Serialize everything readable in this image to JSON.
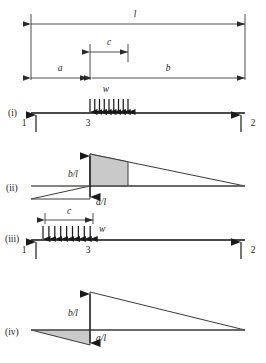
{
  "figure": {
    "colors": {
      "ink": "#1a1a1a",
      "line": "#3a3a3a",
      "beam": "#4a4a4a",
      "shade_fill": "#c9c9c9",
      "background": "#ffffff"
    },
    "dimensions": {
      "span_total": {
        "label": "l",
        "x1": 31,
        "x2": 245,
        "y": 18
      },
      "segment_c_top": {
        "label": "c",
        "x1": 90,
        "x2": 128,
        "y": 48
      },
      "segment_a": {
        "label": "a",
        "x1": 31,
        "x2": 90,
        "y": 76
      },
      "segment_b": {
        "label": "b",
        "x1": 90,
        "x2": 245,
        "y": 76
      }
    },
    "panels": [
      {
        "id": "i",
        "roman": "(i)",
        "roman_x": 8,
        "roman_y": 113,
        "beam_y": 113,
        "beam_x1": 31,
        "beam_x2": 245,
        "load_label": "w",
        "load_label_x": 106,
        "load_label_y": 92,
        "load_x1": 90,
        "load_x2": 128,
        "load_count": 9,
        "load_direction": "down",
        "nodes": [
          {
            "label": "1",
            "x": 24,
            "y": 125,
            "support_x": 36
          },
          {
            "label": "3",
            "x": 88,
            "y": 125,
            "support_x": null
          },
          {
            "label": "2",
            "x": 252,
            "y": 125,
            "support_x": 241
          }
        ]
      },
      {
        "id": "ii",
        "roman": "(ii)",
        "roman_x": 6,
        "roman_y": 188,
        "baseline_y": 186,
        "baseline_x1": 31,
        "baseline_x2": 245,
        "peak_x": 90,
        "peak_top_y": 154,
        "peak_bottom_y": 199,
        "shade_right_x": 128,
        "labels": [
          {
            "text": "b/l",
            "x": 70,
            "y": 174
          },
          {
            "text": "a/l",
            "x": 96,
            "y": 205
          }
        ],
        "shaded_shape": "quad-above",
        "lower_wing_x": 31
      },
      {
        "id": "iii",
        "roman": "(iii)",
        "roman_x": 5,
        "roman_y": 239,
        "beam_y": 240,
        "beam_x1": 31,
        "beam_x2": 245,
        "load_label": "w",
        "load_label_x": 98,
        "load_label_y": 224,
        "load_x1": 36,
        "load_x2": 90,
        "load_count": 9,
        "load_direction": "up",
        "dim_c": {
          "label": "c",
          "x1": 45,
          "x2": 93,
          "y": 219
        },
        "nodes": [
          {
            "label": "1",
            "x": 24,
            "y": 252,
            "support_x": 36
          },
          {
            "label": "3",
            "x": 88,
            "y": 252,
            "support_x": null
          },
          {
            "label": "2",
            "x": 252,
            "y": 252,
            "support_x": 241
          }
        ]
      },
      {
        "id": "iv",
        "roman": "(iv)",
        "roman_x": 5,
        "roman_y": 332,
        "baseline_y": 330,
        "baseline_x1": 31,
        "baseline_x2": 245,
        "peak_x": 90,
        "peak_top_y": 292,
        "peak_bottom_y": 345,
        "labels": [
          {
            "text": "b/l",
            "x": 70,
            "y": 313
          },
          {
            "text": "a/l",
            "x": 96,
            "y": 341
          }
        ],
        "shaded_shape": "tri-below",
        "lower_wing_x": 31
      }
    ]
  }
}
